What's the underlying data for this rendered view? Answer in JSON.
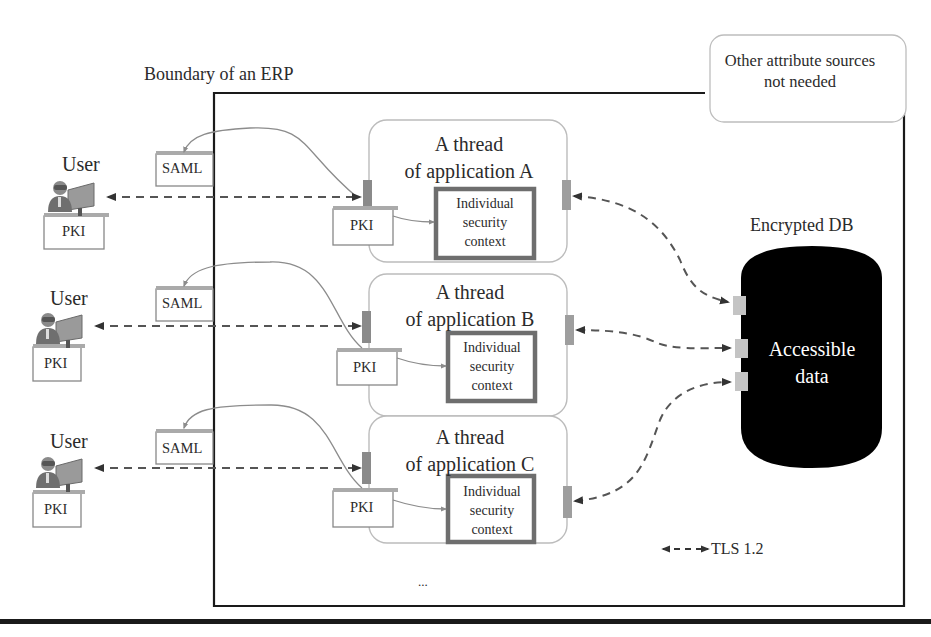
{
  "diagram": {
    "boundary_label": "Boundary of an ERP",
    "other_sources": {
      "line1": "Other attribute sources",
      "line2": "not needed"
    },
    "database": {
      "title": "Encrypted DB",
      "line1": "Accessible",
      "line2": "data",
      "fill": "#000000"
    },
    "legend": {
      "label": "TLS 1.2",
      "icon": "dashed-double-arrow"
    },
    "ellipsis": "...",
    "rows": [
      {
        "user_label": "User",
        "user_doc": "PKI",
        "saml_doc": "SAML",
        "thread_line1": "A thread",
        "thread_line2": "of application A",
        "app_doc": "PKI",
        "context_line1": "Individual",
        "context_line2": "security",
        "context_line3": "context"
      },
      {
        "user_label": "User",
        "user_doc": "PKI",
        "saml_doc": "SAML",
        "thread_line1": "A thread",
        "thread_line2": "of application B",
        "app_doc": "PKI",
        "context_line1": "Individual",
        "context_line2": "security",
        "context_line3": "context"
      },
      {
        "user_label": "User",
        "user_doc": "PKI",
        "saml_doc": "SAML",
        "thread_line1": "A thread",
        "thread_line2": "of application C",
        "app_doc": "PKI",
        "context_line1": "Individual",
        "context_line2": "security",
        "context_line3": "context"
      }
    ],
    "colors": {
      "boundary": "#1a1a1a",
      "thread_border": "#b8b8b8",
      "context_border": "#6e6e6e",
      "port": "#8a8a8a",
      "db_port": "#c4c4c4",
      "dashed_arrow": "#555555",
      "curve": "#8c8c8c"
    }
  }
}
